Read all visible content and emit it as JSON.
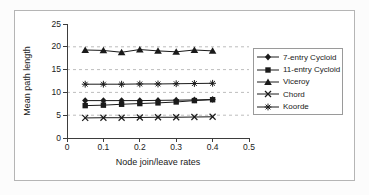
{
  "chart_data": {
    "type": "line",
    "title": "",
    "xlabel": "Node join/leave rates",
    "ylabel": "Mean path length",
    "xlim": [
      0,
      0.5
    ],
    "ylim": [
      0,
      25
    ],
    "xticks": [
      0,
      0.1,
      0.2,
      0.3,
      0.4,
      0.5
    ],
    "yticks": [
      0,
      5,
      10,
      15,
      20,
      25
    ],
    "grid_y": [
      5,
      10,
      15,
      20
    ],
    "grid_style": "dashed",
    "legend_position": "right",
    "x": [
      0.05,
      0.1,
      0.15,
      0.2,
      0.25,
      0.3,
      0.35,
      0.4
    ],
    "series": [
      {
        "name": "7-entry Cycloid",
        "marker": "diamond",
        "values": [
          8.2,
          8.2,
          8.2,
          8.2,
          8.25,
          8.3,
          8.35,
          8.45
        ]
      },
      {
        "name": "11-entry Cycloid",
        "marker": "square",
        "values": [
          7.1,
          7.2,
          7.4,
          7.55,
          7.7,
          7.9,
          8.2,
          8.4
        ]
      },
      {
        "name": "Viceroy",
        "marker": "triangle",
        "values": [
          19.3,
          19.2,
          18.8,
          19.4,
          19.1,
          18.9,
          19.3,
          19.1
        ]
      },
      {
        "name": "Chord",
        "marker": "x",
        "values": [
          4.4,
          4.45,
          4.45,
          4.5,
          4.55,
          4.55,
          4.6,
          4.65
        ]
      },
      {
        "name": "Koorde",
        "marker": "star",
        "values": [
          11.8,
          11.8,
          11.8,
          11.85,
          11.85,
          11.9,
          11.95,
          12.0
        ]
      }
    ],
    "colors": {
      "series": "#1a1a1a",
      "axis": "#3d3d3d",
      "grid": "#bdbdbd",
      "frame_border": "#b5b5b5",
      "legend_border": "#9a9a9a",
      "background": "#ffffff"
    }
  }
}
